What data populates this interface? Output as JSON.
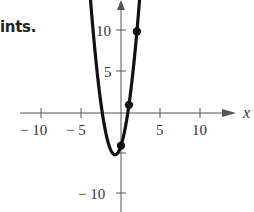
{
  "caption": "ints.",
  "chart_data": {
    "type": "line",
    "title": "",
    "xlabel": "x",
    "ylabel": "",
    "function": "y = 2x^2 + 3x - 4",
    "xlim": [
      -14,
      15
    ],
    "ylim": [
      -12,
      14
    ],
    "x_ticks": [
      -10,
      -5,
      5,
      10
    ],
    "x_tick_labels": [
      "− 10",
      "− 5",
      "5",
      "10"
    ],
    "y_ticks": [
      10,
      5,
      -10
    ],
    "y_tick_labels": [
      "10",
      "5",
      "− 10"
    ],
    "grid": false,
    "series": [
      {
        "name": "parabola",
        "x": [
          -3.9,
          -3,
          -2,
          -1.5,
          -1,
          -0.75,
          -0.5,
          0,
          0.5,
          1,
          1.5,
          2,
          2.34
        ],
        "values": [
          14.72,
          5,
          -2,
          -4,
          -5,
          -5.125,
          -5,
          -4,
          -2,
          1,
          5,
          10,
          14.0
        ]
      }
    ],
    "points": [
      {
        "x": 0,
        "y": -4
      },
      {
        "x": 1,
        "y": 1
      },
      {
        "x": 2,
        "y": 10
      }
    ],
    "colors": {
      "curve": "#111111",
      "axes": "#555555",
      "points": "#111111"
    }
  }
}
